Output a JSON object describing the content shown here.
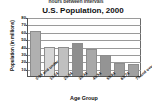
{
  "page": {
    "cutoff_caption": "hours between intervals"
  },
  "chart_data": {
    "type": "bar",
    "title": "U.S. Population, 2000",
    "xlabel": "Age Group",
    "ylabel": "Population (in millions)",
    "categories": [
      "0-14 and under",
      "15-24",
      "25-34",
      "35-44",
      "45-54",
      "55-64",
      "65-74",
      "75 and over"
    ],
    "values": [
      61,
      39,
      39,
      45,
      37,
      29,
      18,
      16
    ],
    "ylim": [
      0,
      80
    ],
    "yticks": [
      80,
      70,
      60,
      50,
      40,
      30,
      20,
      10
    ],
    "ytick_labels": [
      "80",
      "70",
      "60",
      "50",
      "40",
      "30",
      "20",
      "10"
    ],
    "grid": true,
    "legend": "none",
    "bar_colors": [
      "#b0b0b0",
      "#d6d6d6",
      "#c0c0c0",
      "#8f8f8f",
      "#a8a8a8",
      "#949494",
      "#9c9c9c",
      "#a0a0a0"
    ],
    "axis_color": "#555555",
    "grid_color": "#9a9a9a",
    "plot_background": "#ffffff"
  }
}
